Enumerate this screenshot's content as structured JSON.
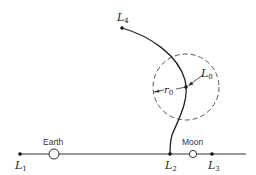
{
  "diagram": {
    "points": {
      "L1": {
        "label": "L",
        "sub": "1"
      },
      "L2": {
        "label": "L",
        "sub": "2"
      },
      "L3": {
        "label": "L",
        "sub": "3"
      },
      "L4": {
        "label": "L",
        "sub": "4"
      },
      "L0": {
        "label": "L",
        "sub": "0"
      }
    },
    "bodies": {
      "earth": "Earth",
      "moon": "Moon"
    },
    "radius_label": {
      "label": "r",
      "sub": "0"
    },
    "colors": {
      "stroke": "#222222",
      "dashed": "#555555"
    }
  }
}
